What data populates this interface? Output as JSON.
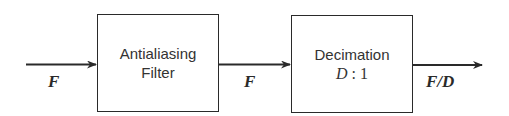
{
  "diagram": {
    "type": "block-diagram",
    "blocks": [
      {
        "id": "antialiasing-filter",
        "lines": [
          "Antialiasing",
          "Filter"
        ]
      },
      {
        "id": "decimation",
        "lines": [
          "Decimation",
          "D : 1"
        ],
        "math": {
          "symbol": "D",
          "ratio": ": 1"
        }
      }
    ],
    "signals": [
      {
        "id": "input",
        "label": "F"
      },
      {
        "id": "filtered",
        "label": "F"
      },
      {
        "id": "output",
        "label": "F/D"
      }
    ],
    "colors": {
      "stroke": "#2a2a2a",
      "text": "#333333",
      "background": "#ffffff"
    }
  }
}
